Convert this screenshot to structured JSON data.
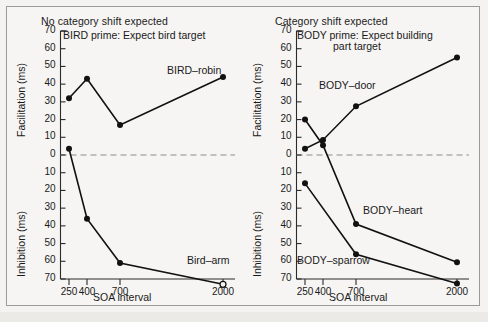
{
  "figure": {
    "panels": [
      {
        "id": "left",
        "title": "No category shift expected",
        "subtitle_line1": "BIRD prime: Expect bird target",
        "subtitle_line2": "",
        "y_label_top": "Facilitation (ms)",
        "y_label_bottom": "Inhibition (ms)",
        "x_label": "SOA interval",
        "y_ticks_top": [
          "70",
          "60",
          "50",
          "40",
          "30",
          "20",
          "10",
          "0"
        ],
        "y_ticks_bottom": [
          "10",
          "20",
          "30",
          "40",
          "50",
          "60",
          "70"
        ],
        "x_ticks": [
          "250",
          "400",
          "700",
          "2000"
        ],
        "series_labels": [
          {
            "text": "BIRD–robin",
            "x": 160,
            "y": 57
          },
          {
            "text": "Bird–arm",
            "x": 180,
            "y": 247
          }
        ]
      },
      {
        "id": "right",
        "title": "Category shift expected",
        "subtitle_line1": "BODY prime: Expect building",
        "subtitle_line2": "part target",
        "y_label_top": "Facilitation (ms)",
        "y_label_bottom": "Inhibition (ms)",
        "x_label": "SOA interval",
        "y_ticks_top": [
          "70",
          "60",
          "50",
          "40",
          "30",
          "20",
          "10",
          "0"
        ],
        "y_ticks_bottom": [
          "10",
          "20",
          "30",
          "40",
          "50",
          "60",
          "70"
        ],
        "x_ticks": [
          "250",
          "400",
          "700",
          "2000"
        ],
        "series_labels": [
          {
            "text": "BODY–door",
            "x": 74,
            "y": 72
          },
          {
            "text": "BODY–heart",
            "x": 118,
            "y": 197
          },
          {
            "text": "BODY–sparrow",
            "x": 52,
            "y": 247
          }
        ]
      }
    ]
  },
  "chart_data": [
    {
      "type": "line",
      "panel": "left",
      "title": "No category shift expected",
      "subtitle": "BIRD prime: Expect bird target",
      "xlabel": "SOA interval",
      "ylabel": "Facilitation (ms) / Inhibition (ms)",
      "x": [
        250,
        400,
        700,
        2000
      ],
      "xtick_labels": [
        "250",
        "400",
        "700",
        "2000"
      ],
      "ylim": [
        -70,
        70
      ],
      "ytick_labels_above_zero": [
        70,
        60,
        50,
        40,
        30,
        20,
        10,
        0
      ],
      "ytick_labels_below_zero": [
        10,
        20,
        30,
        40,
        50,
        60,
        70
      ],
      "zero_line": true,
      "grid": false,
      "legend": "inline-annotations",
      "series": [
        {
          "name": "BIRD–robin",
          "marker": "filled-circle",
          "values": [
            32,
            43,
            17,
            44
          ]
        },
        {
          "name": "Bird–arm",
          "marker": "filled-circle",
          "last_marker": "open-circle",
          "values": [
            3.5,
            -36,
            -61,
            -73
          ]
        }
      ]
    },
    {
      "type": "line",
      "panel": "right",
      "title": "Category shift expected",
      "subtitle": "BODY prime: Expect building part target",
      "xlabel": "SOA interval",
      "ylabel": "Facilitation (ms) / Inhibition (ms)",
      "x": [
        250,
        400,
        700,
        2000
      ],
      "xtick_labels": [
        "250",
        "400",
        "700",
        "2000"
      ],
      "ylim": [
        -70,
        70
      ],
      "ytick_labels_above_zero": [
        70,
        60,
        50,
        40,
        30,
        20,
        10,
        0
      ],
      "ytick_labels_below_zero": [
        10,
        20,
        30,
        40,
        50,
        60,
        70
      ],
      "zero_line": true,
      "grid": false,
      "legend": "inline-annotations",
      "series": [
        {
          "name": "BODY–door",
          "marker": "filled-circle",
          "values": [
            3.5,
            8.5,
            27.5,
            55
          ]
        },
        {
          "name": "BODY–heart",
          "marker": "filled-circle",
          "values": [
            20,
            5.5,
            -39,
            -60.5
          ]
        },
        {
          "name": "BODY–sparrow",
          "marker": "filled-circle",
          "values": [
            -16,
            null,
            -56,
            -72.5
          ]
        }
      ]
    }
  ]
}
